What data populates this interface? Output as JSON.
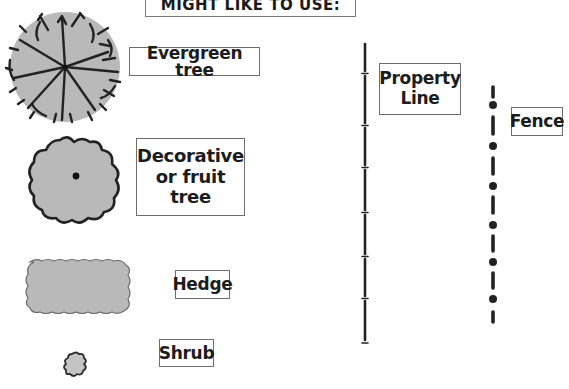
{
  "banner": {
    "text": "MIGHT LIKE TO USE:"
  },
  "legend": {
    "evergreen": {
      "label": "Evergreen tree",
      "symbol": "evergreen-tree-icon"
    },
    "decorative": {
      "label_lines": [
        "Decorative",
        "or fruit",
        "tree"
      ],
      "symbol": "decorative-tree-icon"
    },
    "hedge": {
      "label": "Hedge",
      "symbol": "hedge-icon"
    },
    "shrub": {
      "label": "Shrub",
      "symbol": "shrub-icon"
    },
    "property_line": {
      "label_lines": [
        "Property",
        "Line"
      ],
      "symbol": "property-line-icon"
    },
    "fence": {
      "label": "Fence",
      "symbol": "fence-icon"
    }
  },
  "colors": {
    "fill_gray": "#b9b9b9",
    "stroke_dark": "#222222",
    "box_border": "#6e6e6e"
  }
}
